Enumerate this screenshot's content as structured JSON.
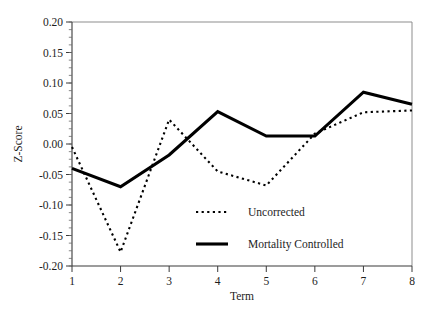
{
  "chart_data": {
    "type": "line",
    "title": "",
    "subtitle": "",
    "xlabel": "Term",
    "ylabel": "Z-Score",
    "x": [
      1,
      2,
      3,
      4,
      5,
      6,
      7,
      8
    ],
    "xlim": [
      1,
      8
    ],
    "ylim": [
      -0.2,
      0.2
    ],
    "xticklabels": [
      "1",
      "2",
      "3",
      "4",
      "5",
      "6",
      "7",
      "8"
    ],
    "yticklabels": [
      "0.20",
      "0.15",
      "0.10",
      "0.05",
      "0.00",
      "-0.05",
      "-0.10",
      "-0.15",
      "-0.20"
    ],
    "ytickvalues": [
      0.2,
      0.15,
      0.1,
      0.05,
      0.0,
      -0.05,
      -0.1,
      -0.15,
      -0.2
    ],
    "grid": false,
    "legend_position": "inside-lower-right",
    "series": [
      {
        "name": "Uncorrected",
        "style": "dotted",
        "color": "#000000",
        "values": [
          -0.005,
          -0.177,
          0.04,
          -0.045,
          -0.068,
          0.017,
          0.052,
          0.055
        ]
      },
      {
        "name": "Mortality Controlled",
        "style": "solid",
        "color": "#000000",
        "values": [
          -0.04,
          -0.07,
          -0.018,
          0.053,
          0.013,
          0.013,
          0.085,
          0.065
        ]
      }
    ]
  },
  "legend": {
    "entries": [
      {
        "label": "Uncorrected",
        "swatch": "dashed-line-swatch"
      },
      {
        "label": "Mortality Controlled",
        "swatch": "solid-line-swatch"
      }
    ]
  },
  "axes": {
    "x_axis_title": "Term",
    "y_axis_title": "Z-Score"
  }
}
